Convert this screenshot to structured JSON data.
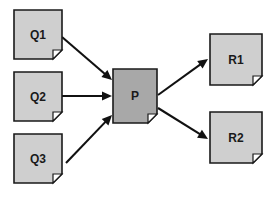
{
  "diagram": {
    "background_color": "#ffffff",
    "colors": {
      "input_node_fill": "#cfcfcf",
      "process_node_fill": "#a8a8a8",
      "output_node_fill": "#cfcfcf",
      "node_border": "#1a1a1a",
      "arrow": "#111111",
      "label_text": "#1a1a1a",
      "fold_fill": "#ffffff"
    },
    "nodes": [
      {
        "id": "q1",
        "label": "Q1",
        "role": "input",
        "x": 14,
        "y": 10,
        "w": 48,
        "h": 49,
        "fill": "#cfcfcf"
      },
      {
        "id": "q2",
        "label": "Q2",
        "role": "input",
        "x": 14,
        "y": 72,
        "w": 48,
        "h": 49,
        "fill": "#cfcfcf"
      },
      {
        "id": "q3",
        "label": "Q3",
        "role": "input",
        "x": 14,
        "y": 134,
        "w": 48,
        "h": 49,
        "fill": "#cfcfcf"
      },
      {
        "id": "p",
        "label": "P",
        "role": "process",
        "x": 113,
        "y": 69,
        "w": 44,
        "h": 54,
        "fill": "#a8a8a8"
      },
      {
        "id": "r1",
        "label": "R1",
        "role": "output",
        "x": 210,
        "y": 34,
        "w": 52,
        "h": 51,
        "fill": "#cfcfcf"
      },
      {
        "id": "r2",
        "label": "R2",
        "role": "output",
        "x": 210,
        "y": 112,
        "w": 52,
        "h": 51,
        "fill": "#cfcfcf"
      }
    ],
    "edges": [
      {
        "id": "e-q1-p",
        "from": "q1",
        "to": "p",
        "x1": 62,
        "y1": 37,
        "x2": 112,
        "y2": 80
      },
      {
        "id": "e-q2-p",
        "from": "q2",
        "to": "p",
        "x1": 62,
        "y1": 96,
        "x2": 112,
        "y2": 96
      },
      {
        "id": "e-q3-p",
        "from": "q3",
        "to": "p",
        "x1": 66,
        "y1": 163,
        "x2": 112,
        "y2": 115
      },
      {
        "id": "e-p-r1",
        "from": "p",
        "to": "r1",
        "x1": 158,
        "y1": 95,
        "x2": 208,
        "y2": 59
      },
      {
        "id": "e-p-r2",
        "from": "p",
        "to": "r2",
        "x1": 158,
        "y1": 108,
        "x2": 208,
        "y2": 139
      }
    ],
    "fold_size": 9
  }
}
